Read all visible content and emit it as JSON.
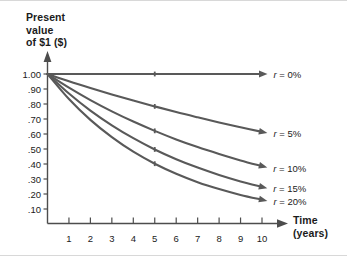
{
  "chart_data": {
    "type": "line",
    "title": "Present value of $1 ($)",
    "ylabel": "Present\nvalue\nof $1 ($)",
    "xlabel": "Time\n(years)",
    "x": [
      0,
      1,
      2,
      3,
      4,
      5,
      6,
      7,
      8,
      9,
      10
    ],
    "xlim": [
      0,
      10
    ],
    "ylim": [
      0,
      1.0
    ],
    "grid": false,
    "legend_position": "right-of-curve-endpoints",
    "x_tick_labels": [
      "1",
      "2",
      "3",
      "4",
      "5",
      "6",
      "7",
      "8",
      "9",
      "10"
    ],
    "x_tick_values": [
      1,
      2,
      3,
      4,
      5,
      6,
      7,
      8,
      9,
      10
    ],
    "y_tick_labels": [
      "1.00",
      ".90",
      ".80",
      ".70",
      ".60",
      ".50",
      ".40",
      ".30",
      ".20",
      ".10"
    ],
    "y_tick_values": [
      1.0,
      0.9,
      0.8,
      0.7,
      0.6,
      0.5,
      0.4,
      0.3,
      0.2,
      0.1
    ],
    "series": [
      {
        "name": "r = 0%",
        "rate_symbol": "r",
        "rate_equals": " = ",
        "rate_value": "0%",
        "rate": 0.0,
        "values": [
          1.0,
          1.0,
          1.0,
          1.0,
          1.0,
          1.0,
          1.0,
          1.0,
          1.0,
          1.0,
          1.0
        ]
      },
      {
        "name": "r = 5%",
        "rate_symbol": "r",
        "rate_equals": " = ",
        "rate_value": "5%",
        "rate": 0.05,
        "values": [
          1.0,
          0.952,
          0.907,
          0.864,
          0.823,
          0.784,
          0.746,
          0.711,
          0.677,
          0.645,
          0.614
        ]
      },
      {
        "name": "r = 10%",
        "rate_symbol": "r",
        "rate_equals": " = ",
        "rate_value": "10%",
        "rate": 0.1,
        "values": [
          1.0,
          0.909,
          0.826,
          0.751,
          0.683,
          0.621,
          0.564,
          0.513,
          0.467,
          0.424,
          0.386
        ]
      },
      {
        "name": "r = 15%",
        "rate_symbol": "r",
        "rate_equals": " = ",
        "rate_value": "15%",
        "rate": 0.15,
        "values": [
          1.0,
          0.87,
          0.756,
          0.658,
          0.572,
          0.497,
          0.432,
          0.376,
          0.327,
          0.284,
          0.247
        ]
      },
      {
        "name": "r = 20%",
        "rate_symbol": "r",
        "rate_equals": " = ",
        "rate_value": "20%",
        "rate": 0.2,
        "values": [
          1.0,
          0.833,
          0.694,
          0.579,
          0.482,
          0.402,
          0.335,
          0.279,
          0.233,
          0.194,
          0.162
        ]
      }
    ],
    "colors": {
      "curve": "#595959",
      "axis": "#4d4d4d",
      "text": "#1b1b1b",
      "background": "#ffffff"
    }
  }
}
